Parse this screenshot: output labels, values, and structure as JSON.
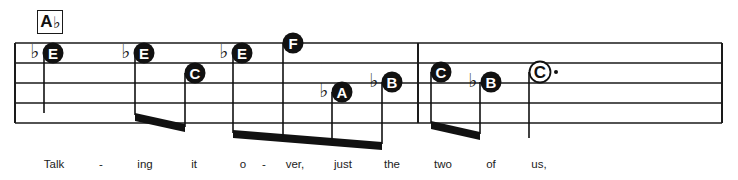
{
  "chord_symbol": {
    "root": "A",
    "accidental": "♭"
  },
  "staff": {
    "left": 15,
    "right": 722,
    "lines_y": [
      43,
      63,
      83,
      103,
      123
    ],
    "barlines_x": [
      15,
      418,
      722
    ],
    "line_color": "#1a1a1a"
  },
  "notes": [
    {
      "letter": "E",
      "accidental": "♭",
      "cx": 53,
      "cy": 53,
      "filled": true,
      "stem_x": 44,
      "stem_end": 113
    },
    {
      "letter": "E",
      "accidental": "♭",
      "cx": 144,
      "cy": 53,
      "filled": true,
      "stem_x": 135,
      "stem_end": 113
    },
    {
      "letter": "C",
      "accidental": "",
      "cx": 195,
      "cy": 73,
      "filled": true,
      "stem_x": 185,
      "stem_end": 125
    },
    {
      "letter": "E",
      "accidental": "♭",
      "cx": 242,
      "cy": 53,
      "filled": true,
      "stem_x": 233,
      "stem_end": 131
    },
    {
      "letter": "F",
      "accidental": "",
      "cx": 293,
      "cy": 43,
      "filled": true,
      "stem_x": 283,
      "stem_end": 135
    },
    {
      "letter": "A",
      "accidental": "♭",
      "cx": 342,
      "cy": 92,
      "filled": true,
      "stem_x": 332,
      "stem_end": 138
    },
    {
      "letter": "B",
      "accidental": "♭",
      "cx": 392,
      "cy": 82,
      "filled": true,
      "stem_x": 382,
      "stem_end": 142
    },
    {
      "letter": "C",
      "accidental": "",
      "cx": 441,
      "cy": 72,
      "filled": true,
      "stem_x": 431,
      "stem_end": 121
    },
    {
      "letter": "B",
      "accidental": "♭",
      "cx": 491,
      "cy": 82,
      "filled": true,
      "stem_x": 480,
      "stem_end": 132
    },
    {
      "letter": "C",
      "accidental": "",
      "cx": 540,
      "cy": 72,
      "filled": false,
      "stem_x": 529,
      "stem_end": 138,
      "dotted": true
    }
  ],
  "beams": [
    {
      "x1": 135,
      "y1": 113,
      "x2": 185,
      "y2": 124
    },
    {
      "x1": 233,
      "y1": 130,
      "x2": 382,
      "y2": 142
    },
    {
      "x1": 431,
      "y1": 121,
      "x2": 480,
      "y2": 132
    }
  ],
  "lyrics": [
    {
      "text": "Talk",
      "x": 54
    },
    {
      "text": "-",
      "x": 101
    },
    {
      "text": "ing",
      "x": 145
    },
    {
      "text": "it",
      "x": 194
    },
    {
      "text": "o",
      "x": 243
    },
    {
      "text": "-",
      "x": 264
    },
    {
      "text": "ver,",
      "x": 295
    },
    {
      "text": "just",
      "x": 343
    },
    {
      "text": "the",
      "x": 392
    },
    {
      "text": "two",
      "x": 443
    },
    {
      "text": "of",
      "x": 491
    },
    {
      "text": "us,",
      "x": 539
    }
  ]
}
